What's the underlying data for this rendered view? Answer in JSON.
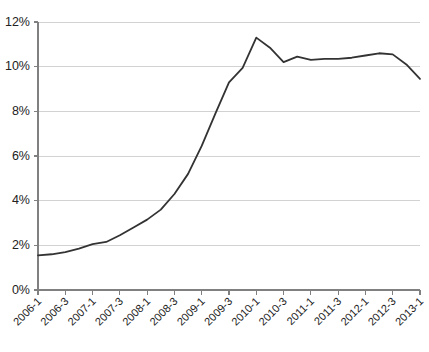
{
  "chart_data": {
    "type": "line",
    "title": "",
    "subtitle": "",
    "xlabel": "",
    "ylabel": "",
    "ylim": [
      0,
      12
    ],
    "ytick_values": [
      0,
      2,
      4,
      6,
      8,
      10,
      12
    ],
    "ytick_labels": [
      "0%",
      "2%",
      "4%",
      "6%",
      "8%",
      "10%",
      "12%"
    ],
    "grid": "horizontal",
    "legend": "none",
    "line_color": "#333333",
    "gridline_color": "#d2d2d2",
    "axis_color": "#808080",
    "x": [
      "2006-1",
      "2006-2",
      "2006-3",
      "2006-4",
      "2007-1",
      "2007-2",
      "2007-3",
      "2007-4",
      "2008-1",
      "2008-2",
      "2008-3",
      "2008-4",
      "2009-1",
      "2009-2",
      "2009-3",
      "2009-4",
      "2010-1",
      "2010-2",
      "2010-3",
      "2010-4",
      "2011-1",
      "2011-2",
      "2011-3",
      "2011-4",
      "2012-1",
      "2012-2",
      "2012-3",
      "2012-4",
      "2013-1"
    ],
    "xtick_labels": [
      "2006-1",
      "2006-3",
      "2007-1",
      "2007-3",
      "2008-1",
      "2008-3",
      "2009-1",
      "2009-3",
      "2010-1",
      "2010-3",
      "2011-1",
      "2011-3",
      "2012-1",
      "2012-3",
      "2013-1"
    ],
    "values": [
      1.55,
      1.6,
      1.7,
      1.85,
      2.05,
      2.15,
      2.45,
      2.8,
      3.15,
      3.6,
      4.3,
      5.2,
      6.45,
      7.9,
      9.3,
      9.95,
      11.3,
      10.85,
      10.2,
      10.45,
      10.3,
      10.35,
      10.35,
      10.4,
      10.5,
      10.6,
      10.55,
      10.1,
      9.45
    ]
  }
}
